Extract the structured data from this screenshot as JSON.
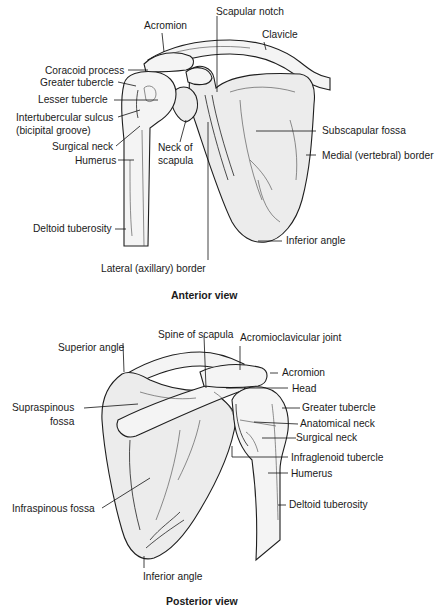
{
  "figure": {
    "background": "#ffffff",
    "bone_fill": "#ececec",
    "line_color": "#1e1e1e"
  },
  "anterior": {
    "title": "Anterior view",
    "labels": {
      "acromion": "Acromion",
      "scapular_notch": "Scapular notch",
      "clavicle": "Clavicle",
      "coracoid_process": "Coracoid process",
      "greater_tubercle": "Greater tubercle",
      "lesser_tubercle": "Lesser tubercle",
      "intertubercular_sulcus_1": "Intertubercular sulcus",
      "intertubercular_sulcus_2": "(bicipital groove)",
      "surgical_neck": "Surgical neck",
      "humerus": "Humerus",
      "neck_of_scapula_1": "Neck of",
      "neck_of_scapula_2": "scapula",
      "subscapular_fossa": "Subscapular fossa",
      "medial_border": "Medial (vertebral) border",
      "deltoid_tuberosity": "Deltoid tuberosity",
      "inferior_angle": "Inferior angle",
      "lateral_border": "Lateral (axillary) border"
    }
  },
  "posterior": {
    "title": "Posterior view",
    "labels": {
      "spine_of_scapula": "Spine of scapula",
      "superior_angle": "Superior angle",
      "acromioclavicular_joint": "Acromioclavicular joint",
      "acromion": "Acromion",
      "head": "Head",
      "supraspinous_fossa_1": "Supraspinous",
      "supraspinous_fossa_2": "fossa",
      "greater_tubercle": "Greater tubercle",
      "anatomical_neck": "Anatomical neck",
      "surgical_neck": "Surgical neck",
      "infraglenoid_tubercle": "Infraglenoid tubercle",
      "humerus": "Humerus",
      "infraspinous_fossa": "Infraspinous fossa",
      "deltoid_tuberosity": "Deltoid tuberosity",
      "inferior_angle": "Inferior angle"
    }
  }
}
